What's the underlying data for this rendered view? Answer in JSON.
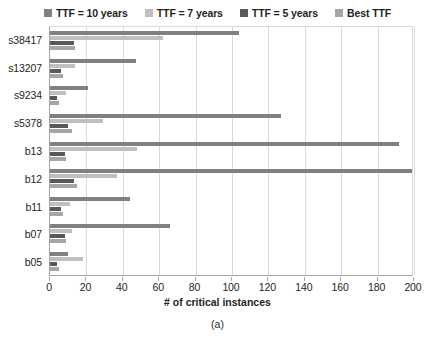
{
  "legend": {
    "position": "top-center",
    "items": [
      {
        "label": "TTF = 10 years",
        "color": "#808080",
        "swatch_name": "legend-swatch-ttf10"
      },
      {
        "label": "TTF = 7 years",
        "color": "#bfbfbf",
        "swatch_name": "legend-swatch-ttf7"
      },
      {
        "label": "TTF = 5 years",
        "color": "#595959",
        "swatch_name": "legend-swatch-ttf5"
      },
      {
        "label": "Best TTF",
        "color": "#a6a6a6",
        "swatch_name": "legend-swatch-best"
      }
    ]
  },
  "caption": "(a)",
  "chart_data": {
    "type": "bar",
    "orientation": "horizontal",
    "title": "",
    "xlabel": "# of critical instances",
    "ylabel": "",
    "xlim": [
      0,
      200
    ],
    "xticks": [
      0,
      20,
      40,
      60,
      80,
      100,
      120,
      140,
      160,
      180,
      200
    ],
    "grid": true,
    "grid_axis": "x",
    "categories": [
      "b05",
      "b07",
      "b11",
      "b12",
      "b13",
      "s5378",
      "s9234",
      "s13207",
      "s38417"
    ],
    "categories_top_to_bottom": [
      "s38417",
      "s13207",
      "s9234",
      "s5378",
      "b13",
      "b12",
      "b11",
      "b07",
      "b05"
    ],
    "series": [
      {
        "name": "TTF = 10 years",
        "color": "#808080",
        "values_top_to_bottom": [
          104,
          47,
          21,
          127,
          192,
          199,
          44,
          66,
          10
        ]
      },
      {
        "name": "TTF = 7 years",
        "color": "#bfbfbf",
        "values_top_to_bottom": [
          62,
          14,
          9,
          29,
          48,
          37,
          11,
          12,
          18
        ]
      },
      {
        "name": "TTF = 5 years",
        "color": "#595959",
        "values_top_to_bottom": [
          13,
          6,
          4,
          10,
          8,
          13,
          6,
          8,
          4
        ]
      },
      {
        "name": "Best TTF",
        "color": "#a6a6a6",
        "values_top_to_bottom": [
          14,
          7,
          5,
          12,
          9,
          15,
          7,
          9,
          5
        ]
      }
    ]
  }
}
